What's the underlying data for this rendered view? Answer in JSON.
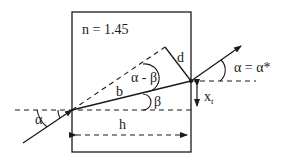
{
  "diagram": {
    "labels": {
      "refractive_index": "n = 1.45",
      "d": "d",
      "alpha_minus_beta": "α - β",
      "b": "b",
      "beta": "β",
      "x_t_main": "x",
      "x_t_sub": "t",
      "alpha_in": "α",
      "alpha_out": "α = α*",
      "h": "h"
    },
    "colors": {
      "stroke": "#1a1a1a",
      "background": "#ffffff"
    }
  }
}
